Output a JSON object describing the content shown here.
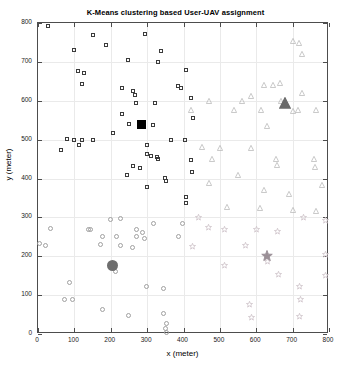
{
  "chart_data": {
    "type": "scatter",
    "title": "K-Means clustering based User-UAV assignment",
    "xlabel": "x (meter)",
    "ylabel": "y (meter)",
    "xlim": [
      0,
      800
    ],
    "ylim": [
      0,
      800
    ],
    "xticks": [
      0,
      100,
      200,
      300,
      400,
      500,
      600,
      700,
      800
    ],
    "yticks": [
      0,
      100,
      200,
      300,
      400,
      500,
      600,
      700,
      800
    ],
    "grid": true,
    "legend": "none",
    "colors": {
      "cluster_square": "#3b3b3b",
      "cluster_square_centroid": "#000000",
      "cluster_triangle": "#b9b9b9",
      "cluster_triangle_centroid": "#6a6a6a",
      "cluster_circle": "#a0a0a0",
      "cluster_circle_centroid": "#6e6e6e",
      "cluster_star": "#cfc5cb",
      "cluster_star_centroid": "#9a8f96",
      "axis": "#4d4d4d",
      "grid_color": "#eaeaea",
      "background": "#ffffff"
    },
    "series": [
      {
        "name": "Cluster 1 users",
        "marker": "square",
        "color": "#3b3b3b",
        "points": [
          [
            28,
            792
          ],
          [
            152,
            770
          ],
          [
            295,
            772
          ],
          [
            188,
            744
          ],
          [
            98,
            730
          ],
          [
            338,
            728
          ],
          [
            248,
            706
          ],
          [
            330,
            700
          ],
          [
            111,
            676
          ],
          [
            126,
            672
          ],
          [
            407,
            678
          ],
          [
            121,
            644
          ],
          [
            385,
            638
          ],
          [
            393,
            632
          ],
          [
            232,
            632
          ],
          [
            262,
            626
          ],
          [
            266,
            616
          ],
          [
            420,
            608
          ],
          [
            270,
            595
          ],
          [
            322,
            593
          ],
          [
            232,
            566
          ],
          [
            425,
            556
          ],
          [
            250,
            540
          ],
          [
            316,
            538
          ],
          [
            205,
            518
          ],
          [
            80,
            502
          ],
          [
            98,
            500
          ],
          [
            122,
            500
          ],
          [
            152,
            498
          ],
          [
            113,
            486
          ],
          [
            300,
            486
          ],
          [
            367,
            498
          ],
          [
            404,
            498
          ],
          [
            62,
            474
          ],
          [
            300,
            462
          ],
          [
            310,
            458
          ],
          [
            328,
            455
          ],
          [
            330,
            449
          ],
          [
            420,
            447
          ],
          [
            260,
            432
          ],
          [
            281,
            426
          ],
          [
            422,
            418
          ],
          [
            244,
            410
          ],
          [
            348,
            402
          ],
          [
            352,
            393
          ],
          [
            300,
            378
          ],
          [
            408,
            352
          ],
          [
            408,
            338
          ]
        ]
      },
      {
        "name": "Cluster 2 users",
        "marker": "triangle",
        "color": "#b9b9b9",
        "points": [
          [
            700,
            775
          ],
          [
            718,
            770
          ],
          [
            727,
            740
          ],
          [
            620,
            660
          ],
          [
            645,
            660
          ],
          [
            664,
            665
          ],
          [
            726,
            640
          ],
          [
            470,
            620
          ],
          [
            560,
            620
          ],
          [
            585,
            632
          ],
          [
            668,
            620
          ],
          [
            420,
            598
          ],
          [
            540,
            598
          ],
          [
            612,
            598
          ],
          [
            700,
            595
          ],
          [
            716,
            598
          ],
          [
            765,
            598
          ],
          [
            630,
            555
          ],
          [
            450,
            502
          ],
          [
            500,
            498
          ],
          [
            586,
            498
          ],
          [
            478,
            470
          ],
          [
            655,
            470
          ],
          [
            658,
            456
          ],
          [
            760,
            470
          ],
          [
            762,
            450
          ],
          [
            550,
            430
          ],
          [
            470,
            410
          ],
          [
            620,
            392
          ],
          [
            690,
            380
          ],
          [
            780,
            405
          ],
          [
            520,
            348
          ],
          [
            610,
            345
          ],
          [
            700,
            340
          ],
          [
            765,
            338
          ]
        ]
      },
      {
        "name": "Cluster 3 users",
        "marker": "circle",
        "color": "#a0a0a0",
        "points": [
          [
            200,
            295
          ],
          [
            228,
            298
          ],
          [
            318,
            285
          ],
          [
            398,
            285
          ],
          [
            33,
            272
          ],
          [
            138,
            268
          ],
          [
            143,
            268
          ],
          [
            270,
            268
          ],
          [
            288,
            262
          ],
          [
            178,
            252
          ],
          [
            215,
            250
          ],
          [
            270,
            250
          ],
          [
            292,
            245
          ],
          [
            385,
            250
          ],
          [
            3,
            232
          ],
          [
            20,
            228
          ],
          [
            172,
            230
          ],
          [
            228,
            228
          ],
          [
            260,
            222
          ],
          [
            205,
            175
          ],
          [
            212,
            162
          ],
          [
            86,
            132
          ],
          [
            298,
            122
          ],
          [
            345,
            118
          ],
          [
            72,
            88
          ],
          [
            95,
            88
          ],
          [
            178,
            62
          ],
          [
            248,
            48
          ],
          [
            345,
            52
          ],
          [
            352,
            26
          ],
          [
            350,
            14
          ],
          [
            352,
            5
          ]
        ]
      },
      {
        "name": "Cluster 4 users",
        "marker": "star",
        "color": "#cfc5cb",
        "points": [
          [
            440,
            318
          ],
          [
            730,
            318
          ],
          [
            790,
            310
          ],
          [
            468,
            292
          ],
          [
            512,
            288
          ],
          [
            600,
            288
          ],
          [
            658,
            282
          ],
          [
            425,
            242
          ],
          [
            570,
            245
          ],
          [
            630,
            205
          ],
          [
            790,
            222
          ],
          [
            512,
            195
          ],
          [
            660,
            170
          ],
          [
            790,
            168
          ],
          [
            718,
            140
          ],
          [
            722,
            108
          ],
          [
            582,
            95
          ],
          [
            588,
            60
          ],
          [
            718,
            62
          ]
        ]
      }
    ],
    "centroids": [
      {
        "name": "Centroid 1",
        "marker": "square",
        "x": 285,
        "y": 540,
        "color": "#000000"
      },
      {
        "name": "Centroid 2",
        "marker": "triangle",
        "x": 680,
        "y": 600,
        "color": "#6a6a6a"
      },
      {
        "name": "Centroid 3",
        "marker": "circle",
        "x": 205,
        "y": 175,
        "color": "#6e6e6e"
      },
      {
        "name": "Centroid 4",
        "marker": "star",
        "x": 630,
        "y": 205,
        "color": "#9a8f96"
      }
    ]
  }
}
